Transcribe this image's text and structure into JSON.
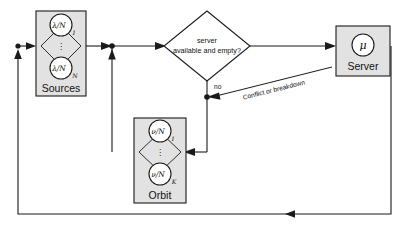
{
  "diagram": {
    "colors": {
      "box_fill": "#e2e2e2",
      "circle_fill": "#ffffff",
      "stroke": "#1a1a1a",
      "background": "#ffffff"
    },
    "nodes": {
      "sources": {
        "label": "Sources",
        "circle_top": {
          "numerator": "λ",
          "denominator": "N",
          "subscript": "1"
        },
        "circle_bottom": {
          "numerator": "λ",
          "denominator": "N",
          "subscript": "N"
        },
        "ellipsis": "⋮"
      },
      "orbit": {
        "label": "Orbit",
        "circle_top": {
          "numerator": "ν",
          "denominator": "N",
          "subscript": "1"
        },
        "circle_bottom": {
          "numerator": "ν",
          "denominator": "N",
          "subscript": "K"
        },
        "ellipsis": "⋮"
      },
      "server": {
        "label": "Server",
        "circle_symbol": "μ"
      },
      "decision": {
        "line1": "server",
        "line2": "available and empty?"
      }
    },
    "edge_labels": {
      "no_branch": "no",
      "conflict": "Conflict or breakdown"
    }
  }
}
